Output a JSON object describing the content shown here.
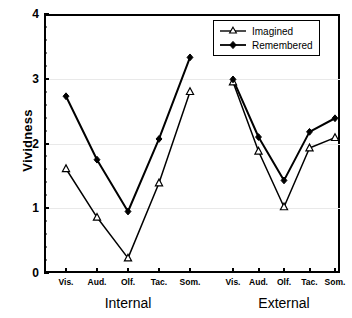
{
  "chart_data": {
    "type": "line",
    "title": "",
    "xlabel": "",
    "ylabel": "Vividness",
    "ylim": [
      0,
      4
    ],
    "yticks": [
      0,
      1,
      2,
      3,
      4
    ],
    "ytick_labels": [
      "0",
      "1",
      "2",
      "3",
      "4"
    ],
    "grid": true,
    "grid_axis": "y",
    "legend_position": "top-right",
    "categories": [
      "Vis.",
      "Aud.",
      "Olf.",
      "Tac.",
      "Som.",
      "Vis.",
      "Aud.",
      "Olf.",
      "Tac.",
      "Som."
    ],
    "groups": [
      {
        "label": "Internal",
        "categories": [
          "Vis.",
          "Aud.",
          "Olf.",
          "Tac.",
          "Som."
        ]
      },
      {
        "label": "External",
        "categories": [
          "Vis.",
          "Aud.",
          "Olf.",
          "Tac.",
          "Som."
        ]
      }
    ],
    "series": [
      {
        "name": "Imagined",
        "marker": "open-triangle",
        "color": "#000000",
        "segments": [
          {
            "group": "Internal",
            "values": [
              1.61,
              0.86,
              0.23,
              1.39,
              2.8
            ]
          },
          {
            "group": "External",
            "values": [
              2.95,
              1.88,
              1.02,
              1.93,
              2.09
            ]
          }
        ]
      },
      {
        "name": "Remembered",
        "marker": "filled-diamond",
        "color": "#000000",
        "segments": [
          {
            "group": "Internal",
            "values": [
              2.73,
              1.75,
              0.95,
              2.07,
              3.33
            ]
          },
          {
            "group": "External",
            "values": [
              2.99,
              2.1,
              1.43,
              2.18,
              2.39
            ]
          }
        ]
      }
    ]
  },
  "legend": {
    "entries": [
      {
        "label": "Imagined"
      },
      {
        "label": "Remembered"
      }
    ]
  },
  "axes": {
    "y_title": "Vividness"
  }
}
